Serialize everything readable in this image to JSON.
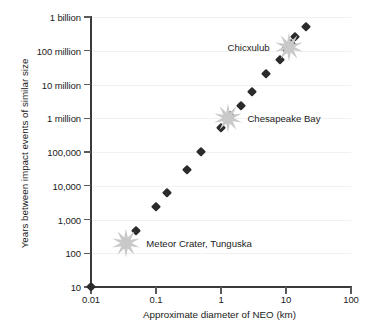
{
  "chart_data": {
    "type": "scatter",
    "title": "",
    "xlabel": "Approximate diameter of NEO (km)",
    "ylabel": "Years between impact events of similar size",
    "xscale": "log",
    "yscale": "log",
    "xlim": [
      0.01,
      100
    ],
    "ylim": [
      10,
      1000000000
    ],
    "grid": true,
    "legend": "none",
    "xticks": [
      {
        "value": 0.01,
        "label": "0.01"
      },
      {
        "value": 0.1,
        "label": "0.1"
      },
      {
        "value": 1,
        "label": "1"
      },
      {
        "value": 10,
        "label": "10"
      },
      {
        "value": 100,
        "label": "100"
      }
    ],
    "yticks": [
      {
        "value": 10,
        "label": "10"
      },
      {
        "value": 100,
        "label": "100"
      },
      {
        "value": 1000,
        "label": "1,000"
      },
      {
        "value": 10000,
        "label": "10,000"
      },
      {
        "value": 100000,
        "label": "100,000"
      },
      {
        "value": 1000000,
        "label": "1 million"
      },
      {
        "value": 10000000,
        "label": "10 million"
      },
      {
        "value": 100000000,
        "label": "100 million"
      },
      {
        "value": 1000000000,
        "label": "1 billion"
      }
    ],
    "series": [
      {
        "name": "Impact interval vs NEO diameter",
        "marker": "diamond",
        "color": "#2b2b2b",
        "points": [
          {
            "x": 0.01,
            "y": 10
          },
          {
            "x": 0.05,
            "y": 470
          },
          {
            "x": 0.1,
            "y": 2400
          },
          {
            "x": 0.15,
            "y": 6000
          },
          {
            "x": 0.3,
            "y": 30000
          },
          {
            "x": 0.5,
            "y": 100000
          },
          {
            "x": 1.0,
            "y": 500000
          },
          {
            "x": 1.4,
            "y": 1200000
          },
          {
            "x": 2.0,
            "y": 2300000
          },
          {
            "x": 3.0,
            "y": 6000000
          },
          {
            "x": 5.0,
            "y": 20000000
          },
          {
            "x": 8.0,
            "y": 55000000
          },
          {
            "x": 10.0,
            "y": 110000000
          },
          {
            "x": 12.0,
            "y": 160000000
          },
          {
            "x": 14.0,
            "y": 250000000
          },
          {
            "x": 20.0,
            "y": 500000000
          }
        ]
      }
    ],
    "annotations": [
      {
        "label": "Meteor Crater, Tunguska",
        "marker": "starburst",
        "color": "#c9c9c9",
        "x": 0.035,
        "y": 200,
        "label_side": "right",
        "label_offset_px": 20
      },
      {
        "label": "Chesapeake Bay",
        "marker": "starburst",
        "color": "#c9c9c9",
        "x": 1.3,
        "y": 1000000,
        "label_side": "right",
        "label_offset_px": 19
      },
      {
        "label": "Chicxulub",
        "marker": "starburst",
        "color": "#c9c9c9",
        "x": 11,
        "y": 130000000,
        "label_side": "left",
        "label_offset_px": -19
      }
    ],
    "colors": {
      "marker": "#2b2b2b",
      "starburst": "#c9c9c9",
      "axis": "#3a3a3a",
      "grid": "#f1f1f1",
      "text": "#1b1b1b",
      "background": "#ffffff"
    }
  }
}
